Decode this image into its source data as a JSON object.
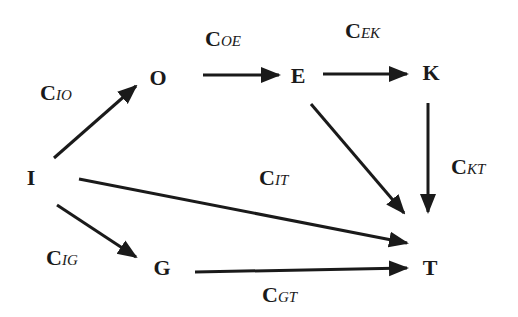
{
  "nodes": {
    "I": "I",
    "O": "O",
    "E": "E",
    "K": "K",
    "G": "G",
    "T": "T"
  },
  "edges": {
    "IO": {
      "c": "C",
      "sub": "IO"
    },
    "OE": {
      "c": "C",
      "sub": "OE"
    },
    "EK": {
      "c": "C",
      "sub": "EK"
    },
    "KT": {
      "c": "C",
      "sub": "KT"
    },
    "IT": {
      "c": "C",
      "sub": "IT"
    },
    "IG": {
      "c": "C",
      "sub": "IG"
    },
    "GT": {
      "c": "C",
      "sub": "GT"
    },
    "ET": {
      "c": "",
      "sub": ""
    }
  },
  "colors": {
    "ink": "#1a1a1a",
    "background": "#ffffff"
  }
}
